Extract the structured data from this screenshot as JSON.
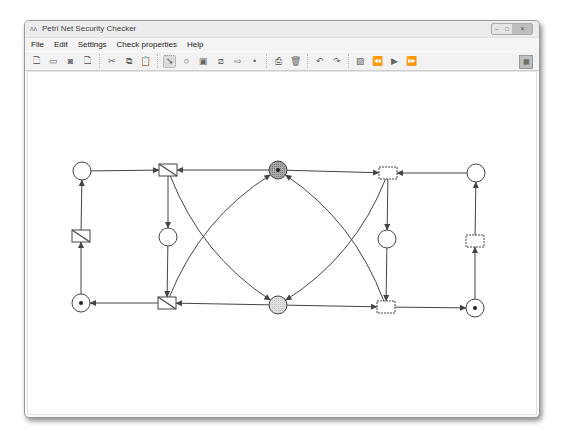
{
  "window": {
    "title": "Petri Net Security Checker",
    "app_icon": "app-icon",
    "controls": [
      "minimize",
      "maximize",
      "close"
    ]
  },
  "menubar": {
    "items": [
      "File",
      "Edit",
      "Settings",
      "Check properties",
      "Help"
    ]
  },
  "toolbar": {
    "groups": [
      [
        {
          "name": "new-icon",
          "glyph": "🗋"
        },
        {
          "name": "open-icon",
          "glyph": "▭"
        },
        {
          "name": "save-icon",
          "glyph": "◙"
        },
        {
          "name": "save-as-icon",
          "glyph": "🗋"
        }
      ],
      [
        {
          "name": "cut-icon",
          "glyph": "✂"
        },
        {
          "name": "copy-icon",
          "glyph": "⧉"
        },
        {
          "name": "paste-icon",
          "glyph": "📋"
        }
      ],
      [
        {
          "name": "select-pointer-icon",
          "glyph": "➘",
          "active": true
        },
        {
          "name": "place-tool-icon",
          "glyph": "○"
        },
        {
          "name": "transition-tool-icon",
          "glyph": "▣"
        },
        {
          "name": "hatched-transition-tool-icon",
          "glyph": "⧄"
        },
        {
          "name": "arc-tool-icon",
          "glyph": "⇨"
        },
        {
          "name": "token-tool-icon",
          "glyph": "•"
        }
      ],
      [
        {
          "name": "print-icon",
          "glyph": "⎙"
        },
        {
          "name": "delete-icon",
          "glyph": "🗑"
        }
      ],
      [
        {
          "name": "undo-icon",
          "glyph": "↶"
        },
        {
          "name": "redo-icon",
          "glyph": "↷"
        }
      ],
      [
        {
          "name": "image-icon",
          "glyph": "▨"
        },
        {
          "name": "step-back-icon",
          "glyph": "⏪"
        },
        {
          "name": "play-icon",
          "glyph": "▶"
        },
        {
          "name": "step-forward-icon",
          "glyph": "⏩"
        }
      ]
    ],
    "right_button": {
      "name": "grid-icon",
      "glyph": "▦"
    }
  },
  "colors": {
    "stroke": "#444444",
    "place_fill": "#ffffff",
    "high_place_fill": "#a8a8a8",
    "low_place_fill": "#e0e0e0",
    "token": "#222222"
  },
  "petri_net": {
    "places": [
      {
        "id": "p_left_top",
        "tokens": 0,
        "kind": "normal"
      },
      {
        "id": "p_center_top",
        "tokens": 1,
        "kind": "high"
      },
      {
        "id": "p_right_top",
        "tokens": 0,
        "kind": "normal"
      },
      {
        "id": "p_left_mid",
        "tokens": 0,
        "kind": "normal"
      },
      {
        "id": "p_right_mid",
        "tokens": 0,
        "kind": "normal"
      },
      {
        "id": "p_left_bot",
        "tokens": 1,
        "kind": "normal"
      },
      {
        "id": "p_center_bot",
        "tokens": 0,
        "kind": "low"
      },
      {
        "id": "p_right_bot",
        "tokens": 1,
        "kind": "normal"
      }
    ],
    "transitions": [
      {
        "id": "t_left_top",
        "hatched": true
      },
      {
        "id": "t_right_top",
        "hatched": false
      },
      {
        "id": "t_far_left",
        "hatched": true
      },
      {
        "id": "t_far_right",
        "hatched": false
      },
      {
        "id": "t_left_bot",
        "hatched": true
      },
      {
        "id": "t_right_bot",
        "hatched": false
      }
    ],
    "arcs": [
      [
        "p_left_top",
        "t_left_top"
      ],
      [
        "p_center_top",
        "t_left_top"
      ],
      [
        "p_center_top",
        "t_right_top"
      ],
      [
        "p_right_top",
        "t_right_top"
      ],
      [
        "t_left_top",
        "p_left_mid"
      ],
      [
        "t_right_top",
        "p_right_mid"
      ],
      [
        "p_left_mid",
        "t_left_bot"
      ],
      [
        "p_right_mid",
        "t_right_bot"
      ],
      [
        "t_far_left",
        "p_left_top"
      ],
      [
        "p_left_bot",
        "t_far_left"
      ],
      [
        "t_left_bot",
        "p_left_bot"
      ],
      [
        "p_center_bot",
        "t_left_bot"
      ],
      [
        "p_center_bot",
        "t_right_bot"
      ],
      [
        "t_right_bot",
        "p_right_bot"
      ],
      [
        "p_right_bot",
        "t_far_right"
      ],
      [
        "t_far_right",
        "p_right_top"
      ],
      [
        "t_left_top",
        "p_center_bot"
      ],
      [
        "t_left_bot",
        "p_center_top"
      ],
      [
        "t_right_top",
        "p_center_bot"
      ],
      [
        "t_right_bot",
        "p_center_top"
      ]
    ]
  }
}
